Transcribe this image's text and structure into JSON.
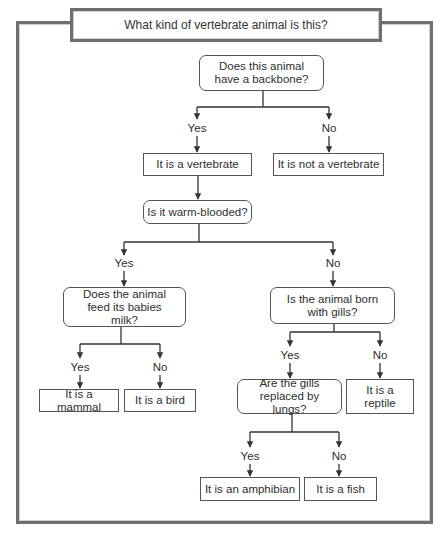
{
  "title": "What kind of vertebrate animal is this?",
  "nodes": {
    "q_backbone": "Does this animal have a backbone?",
    "r_vertebrate": "It is a vertebrate",
    "r_not_vertebrate": "It is not a vertebrate",
    "q_warm": "Is it warm-blooded?",
    "q_milk": "Does the animal feed its babies milk?",
    "q_gills": "Is the animal born with gills?",
    "r_mammal": "It is a mammal",
    "r_bird": "It is a bird",
    "q_lungs": "Are the gills replaced by lungs?",
    "r_reptile": "It is a reptile",
    "r_amphibian": "It is an amphibian",
    "r_fish": "It is a fish"
  },
  "edges": {
    "yes": "Yes",
    "no": "No"
  },
  "colors": {
    "frame": "#6f6f6f",
    "line": "#333333",
    "text": "#2e2e2e"
  }
}
